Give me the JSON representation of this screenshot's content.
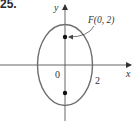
{
  "problem": {
    "number": "25."
  },
  "diagram": {
    "type": "ellipse-with-foci",
    "axes": {
      "x_label": "x",
      "y_label": "y",
      "origin_label": "0"
    },
    "ellipse": {
      "center": [
        0,
        0
      ],
      "semi_minor_x": 2,
      "x_intercept_label": "2",
      "stroke_color": "#6e6e6e"
    },
    "foci": [
      {
        "label": "F(0, 2)",
        "coords": [
          0,
          2
        ],
        "labeled": true
      },
      {
        "label": "",
        "coords": [
          0,
          -2
        ],
        "labeled": false
      }
    ],
    "colors": {
      "axis": "#555555",
      "point": "#111111",
      "text": "#333333"
    }
  }
}
